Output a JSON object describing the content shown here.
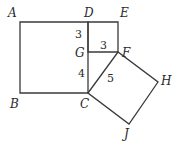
{
  "diagram": {
    "title": "",
    "points": {
      "A": {
        "label": "A",
        "x": 20,
        "y": 22,
        "lx": 8,
        "ly": 17
      },
      "D": {
        "label": "D",
        "x": 88,
        "y": 22,
        "lx": 84,
        "ly": 17
      },
      "E": {
        "label": "E",
        "x": 118,
        "y": 22,
        "lx": 120,
        "ly": 17
      },
      "G": {
        "label": "G",
        "x": 88,
        "y": 52,
        "lx": 75,
        "ly": 57
      },
      "F": {
        "label": "F",
        "x": 118,
        "y": 52,
        "lx": 122,
        "ly": 57
      },
      "B": {
        "label": "B",
        "x": 20,
        "y": 93,
        "lx": 10,
        "ly": 108
      },
      "C": {
        "label": "C",
        "x": 88,
        "y": 93,
        "lx": 80,
        "ly": 108
      },
      "H": {
        "label": "H",
        "x": 158,
        "y": 82,
        "lx": 161,
        "ly": 85
      },
      "J": {
        "label": "J",
        "x": 129,
        "y": 124,
        "lx": 124,
        "ly": 138
      }
    },
    "segment_labels": {
      "DG": {
        "text": "3",
        "x": 75,
        "y": 38
      },
      "GF": {
        "text": "3",
        "x": 100,
        "y": 49
      },
      "GC": {
        "text": "4",
        "x": 78,
        "y": 77
      },
      "CF": {
        "text": "5",
        "x": 107,
        "y": 82
      }
    },
    "shapes": [
      {
        "name": "square-ABCD",
        "vertices": [
          "A",
          "D",
          "C",
          "B"
        ]
      },
      {
        "name": "square-DEFG",
        "vertices": [
          "D",
          "E",
          "F",
          "G"
        ]
      },
      {
        "name": "triangle-CGF",
        "vertices": [
          "C",
          "G",
          "F"
        ]
      },
      {
        "name": "square-CFHJ",
        "vertices": [
          "C",
          "F",
          "H",
          "J"
        ]
      }
    ]
  }
}
